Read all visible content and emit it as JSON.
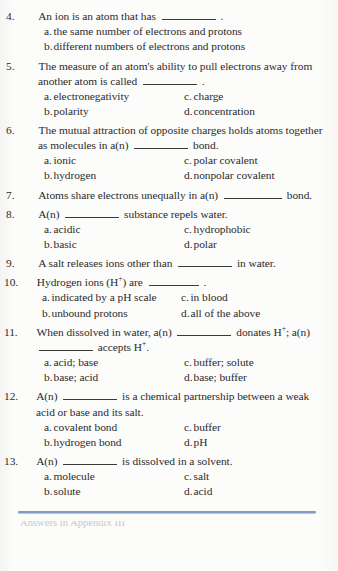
{
  "document": {
    "type": "textbook-quiz-page",
    "accent_rule_color": "#7f9bc4",
    "text_color": "#2b2b2b",
    "background_color": "#fbfbfa"
  },
  "questions": [
    {
      "number": "4.",
      "stem_before": "An ion is an atom that has",
      "stem_after": ".",
      "options": [
        {
          "letter": "a.",
          "text": "the same number of electrons and protons"
        },
        {
          "letter": "b.",
          "text": "different numbers of electrons and protons"
        }
      ],
      "layout": "stacked"
    },
    {
      "number": "5.",
      "stem_before": "The measure of an atom's ability to pull electrons away from another atom is called",
      "stem_after": ".",
      "options": [
        {
          "letter": "a.",
          "text": "electronegativity"
        },
        {
          "letter": "c.",
          "text": "charge"
        },
        {
          "letter": "b.",
          "text": "polarity"
        },
        {
          "letter": "d.",
          "text": "concentration"
        }
      ],
      "layout": "two-column"
    },
    {
      "number": "6.",
      "stem_before": "The mutual attraction of opposite charges holds atoms together as molecules in a(n)",
      "stem_after": "bond.",
      "options": [
        {
          "letter": "a.",
          "text": "ionic"
        },
        {
          "letter": "c.",
          "text": "polar covalent"
        },
        {
          "letter": "b.",
          "text": "hydrogen"
        },
        {
          "letter": "d.",
          "text": "nonpolar covalent"
        }
      ],
      "layout": "two-column"
    },
    {
      "number": "7.",
      "stem_before": "Atoms share electrons unequally in a(n)",
      "stem_after": "bond.",
      "options": [],
      "layout": "none"
    },
    {
      "number": "8.",
      "stem_before": "A(n)",
      "stem_after": "substance repels water.",
      "options": [
        {
          "letter": "a.",
          "text": "acidic"
        },
        {
          "letter": "c.",
          "text": "hydrophobic"
        },
        {
          "letter": "b.",
          "text": "basic"
        },
        {
          "letter": "d.",
          "text": "polar"
        }
      ],
      "layout": "two-column"
    },
    {
      "number": "9.",
      "stem_before": "A salt releases ions other than",
      "stem_after": "in water.",
      "options": [],
      "layout": "none"
    },
    {
      "number": "10.",
      "stem_before": "Hydrogen ions (H+) are",
      "stem_after": ".",
      "options": [
        {
          "letter": "a.",
          "text": "indicated by a pH scale"
        },
        {
          "letter": "c.",
          "text": "in blood"
        },
        {
          "letter": "b.",
          "text": "unbound protons"
        },
        {
          "letter": "d.",
          "text": "all of the above"
        }
      ],
      "layout": "two-column-narrow"
    },
    {
      "number": "11.",
      "stem_before": "When dissolved in water, a(n)",
      "stem_middle": "donates H+; a(n)",
      "stem_after": "accepts H+.",
      "options": [
        {
          "letter": "a.",
          "text": "acid; base"
        },
        {
          "letter": "c.",
          "text": "buffer; solute"
        },
        {
          "letter": "b.",
          "text": "base; acid"
        },
        {
          "letter": "d.",
          "text": "base; buffer"
        }
      ],
      "layout": "two-column"
    },
    {
      "number": "12.",
      "stem_before": "A(n)",
      "stem_after": "is a chemical partnership between a weak acid or base and its salt.",
      "options": [
        {
          "letter": "a.",
          "text": "covalent bond"
        },
        {
          "letter": "c.",
          "text": "buffer"
        },
        {
          "letter": "b.",
          "text": "hydrogen bond"
        },
        {
          "letter": "d.",
          "text": "pH"
        }
      ],
      "layout": "two-column"
    },
    {
      "number": "13.",
      "stem_before": "A(n)",
      "stem_after": "is dissolved in a solvent.",
      "options": [
        {
          "letter": "a.",
          "text": "molecule"
        },
        {
          "letter": "c.",
          "text": "salt"
        },
        {
          "letter": "b.",
          "text": "solute"
        },
        {
          "letter": "d.",
          "text": "acid"
        }
      ],
      "layout": "two-column"
    }
  ],
  "superscripts": {
    "plus": "+"
  },
  "footer": {
    "cut_off_text": "Answers in Appendix III"
  }
}
